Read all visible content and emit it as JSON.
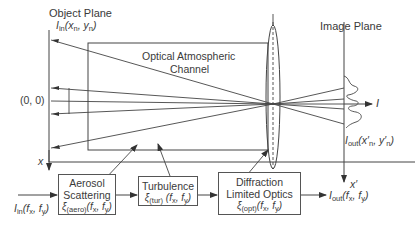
{
  "diagram": {
    "object_plane": {
      "label": "Object Plane",
      "intensity_symbol": "I",
      "intensity_sub": "in",
      "intensity_args": "(x",
      "arg1_sub": "n",
      "arg_sep": ", y",
      "arg2_sub": "n",
      "arg_close": ")",
      "origin_label": "(0, 0)",
      "axis_label": "x"
    },
    "channel": {
      "line1": "Optical Atmospheric",
      "line2": "Channel"
    },
    "image_plane": {
      "label": "Image Plane",
      "output_symbol": "I",
      "output_sub": "out",
      "output_args": "(x′",
      "arg1_sub": "n",
      "arg_sep": ", y′",
      "arg2_sub": "n",
      "arg_close": ")",
      "axis_label": "x′",
      "intensity_axis_label": "I"
    },
    "pipeline": {
      "input": {
        "symbol": "I",
        "sub": "in",
        "args": "(f",
        "a1": "x",
        "sep": ", f",
        "a2": "y",
        "close": ")"
      },
      "blocks": [
        {
          "name": "aerosol",
          "line1": "Aerosol",
          "line2": "Scattering",
          "xi": "ξ",
          "xi_sub": "(aero)",
          "args": "(f",
          "a1": "x",
          "sep": ", f",
          "a2": "y",
          "close": ")"
        },
        {
          "name": "turbulence",
          "line1": "Turbulence",
          "line2": "",
          "xi": "ξ",
          "xi_sub": "(tur)",
          "args": " (f",
          "a1": "x",
          "sep": ", f",
          "a2": "y",
          "close": ")"
        },
        {
          "name": "optics",
          "line1": "Diffraction",
          "line2": "Limited Optics",
          "xi": "ξ",
          "xi_sub": "(opt)",
          "args": "(f",
          "a1": "x",
          "sep": ", f",
          "a2": "y",
          "close": ")"
        }
      ],
      "output": {
        "symbol": "I",
        "sub": "out",
        "args": "(f",
        "a1": "x",
        "sep": ", f",
        "a2": "y",
        "close": ")"
      }
    },
    "colors": {
      "line": "#444444",
      "text": "#3a3a3a",
      "background": "#ffffff"
    }
  }
}
